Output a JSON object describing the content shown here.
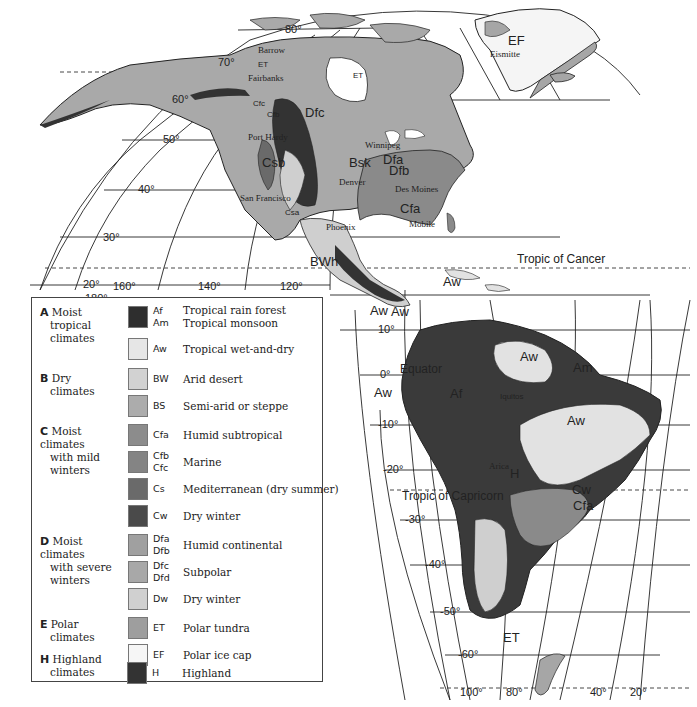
{
  "map": {
    "title": "Climate regions of the Americas (Köppen)",
    "longitude_labels_top": [
      "180°",
      "160°",
      "140°",
      "120°"
    ],
    "longitude_labels_bottom": [
      "100°",
      "80°",
      "40°",
      "20°"
    ],
    "latitude_labels": [
      "80°",
      "70°",
      "60°",
      "50°",
      "40°",
      "30°",
      "20°",
      "10°",
      "0°",
      "-10°",
      "-20°",
      "-30°",
      "-40°",
      "-50°",
      "-60°"
    ],
    "reference_lines": {
      "tropic_of_cancer": "Tropic of Cancer",
      "equator": "Equator",
      "tropic_of_capricorn": "Tropic of Capricorn"
    },
    "cities": [
      "Barrow",
      "Fairbanks",
      "Eismitte",
      "Port Hardy",
      "Winnipeg",
      "Denver",
      "Des Moines",
      "San Francisco",
      "Phoenix",
      "Mobile",
      "Iquitos",
      "Arica"
    ],
    "region_labels": [
      "ET",
      "EF",
      "E",
      "Dfc",
      "Cfc",
      "Cfb",
      "Csb",
      "Csa",
      "Bs",
      "Bsk",
      "BWk",
      "H",
      "Dfb",
      "Dfa",
      "Cfa",
      "BSh",
      "BWh",
      "Cf",
      "Aw",
      "Af",
      "Am",
      "BW",
      "Cw",
      "Cs"
    ]
  },
  "legend": {
    "groups": [
      {
        "letter": "A",
        "name": "Moist tropical climates",
        "lines": [
          "Moist",
          "tropical",
          "climates"
        ]
      },
      {
        "letter": "B",
        "name": "Dry climates",
        "lines": [
          "Dry",
          "climates"
        ]
      },
      {
        "letter": "C",
        "name": "Moist climates with mild winters",
        "lines": [
          "Moist climates",
          "with mild",
          "winters"
        ]
      },
      {
        "letter": "D",
        "name": "Moist climates with severe winters",
        "lines": [
          "Moist climates",
          "with severe",
          "winters"
        ]
      },
      {
        "letter": "E",
        "name": "Polar climates",
        "lines": [
          "Polar",
          "climates"
        ]
      },
      {
        "letter": "H",
        "name": "Highland climates",
        "lines": [
          "Highland",
          "climates"
        ]
      }
    ],
    "entries": [
      {
        "codes": "Af\nAm",
        "description": "Tropical rain forest\nTropical monsoon",
        "color": "#2e2e2e"
      },
      {
        "codes": "Aw",
        "description": "Tropical wet-and-dry",
        "color": "#e6e6e6"
      },
      {
        "codes": "BW",
        "description": "Arid desert",
        "color": "#d2d2d2"
      },
      {
        "codes": "BS",
        "description": "Semi-arid or steppe",
        "color": "#acacac"
      },
      {
        "codes": "Cfa",
        "description": "Humid subtropical",
        "color": "#8c8c8c"
      },
      {
        "codes": "Cfb\nCfc",
        "description": "Marine",
        "color": "#848484"
      },
      {
        "codes": "Cs",
        "description": "Mediterranean (dry summer)",
        "color": "#6a6a6a"
      },
      {
        "codes": "Cw",
        "description": "Dry winter",
        "color": "#4a4a4a"
      },
      {
        "codes": "Dfa\nDfb",
        "description": "Humid continental",
        "color": "#a0a0a0"
      },
      {
        "codes": "Dfc\nDfd",
        "description": "Subpolar",
        "color": "#a8a8a8"
      },
      {
        "codes": "Dw",
        "description": "Dry winter",
        "color": "#d0d0d0"
      },
      {
        "codes": "ET",
        "description": "Polar tundra",
        "color": "#9e9e9e"
      },
      {
        "codes": "EF",
        "description": "Polar ice cap",
        "color": "#f6f6f6"
      },
      {
        "codes": "H",
        "description": "Highland",
        "color": "#333333"
      }
    ]
  },
  "colors": {
    "land_dfc": "#a9a9a9",
    "highland": "#333333",
    "tropical_dark": "#3a3a3a",
    "aw": "#e2e2e2",
    "cfa": "#8a8a8a",
    "dry_light": "#cfcfcf",
    "ice": "#f5f5f5",
    "grid": "#222222"
  }
}
